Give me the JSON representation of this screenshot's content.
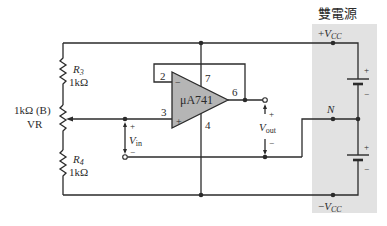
{
  "diagram": {
    "title": "雙電源",
    "opamp": {
      "label": "μA741",
      "pins": {
        "inverting": "2",
        "noninverting": "3",
        "output": "6",
        "vplus": "7",
        "vminus": "4"
      },
      "minus_sign": "−",
      "plus_sign": "+"
    },
    "resistors": {
      "r3": {
        "name": "R",
        "sub": "3",
        "value": "1kΩ"
      },
      "r4": {
        "name": "R",
        "sub": "4",
        "value": "1kΩ"
      },
      "vr": {
        "value": "1kΩ (B)",
        "name": "VR"
      }
    },
    "input": {
      "name": "V",
      "sub": "in",
      "plus": "+",
      "minus": "−"
    },
    "output": {
      "name": "V",
      "sub": "out",
      "plus": "+",
      "minus": "−"
    },
    "supply": {
      "positive": {
        "sign": "+",
        "name": "V",
        "sub": "CC"
      },
      "negative": {
        "sign": "−",
        "name": "V",
        "sub": "CC"
      },
      "neutral": "N",
      "battery_plus": "+",
      "battery_minus": "−"
    },
    "colors": {
      "wire": "#2b2b2b",
      "opamp_fill": "#b5b5b5",
      "panel_fill": "#e2e2e2"
    }
  }
}
